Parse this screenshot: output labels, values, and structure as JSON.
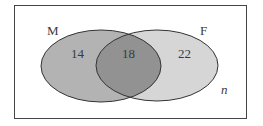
{
  "diagram": {
    "type": "venn",
    "universe_label": "n",
    "sets": [
      {
        "name": "M",
        "only_value": "14",
        "fill": "#b3b3b3"
      },
      {
        "name": "F",
        "only_value": "22",
        "fill": "#d6d6d6"
      }
    ],
    "intersection_value": "18",
    "intersection_fill": "#929292",
    "stroke": "#333333"
  }
}
